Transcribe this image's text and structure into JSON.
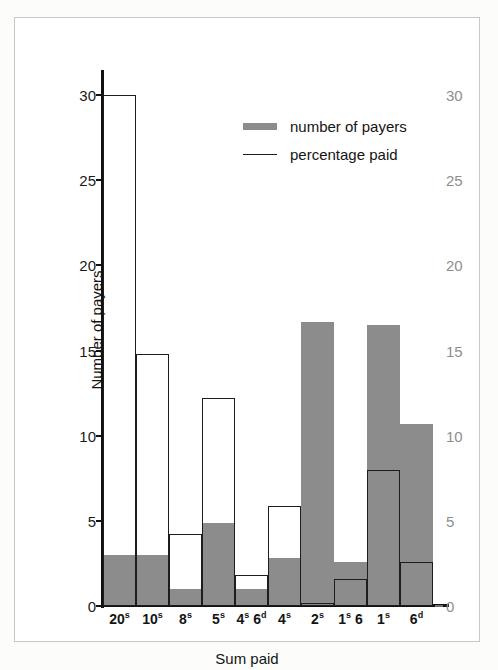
{
  "chart_data": {
    "type": "bar",
    "title": "",
    "xlabel": "Sum paid",
    "ylabel": "Number of payers",
    "ylabel_right": "Percentage of whole sum",
    "categories": [
      "20s",
      "10s",
      "8s",
      "5s",
      "4s 6d",
      "4s",
      "2s",
      "1s 6",
      "1s",
      "6d"
    ],
    "category_labels": [
      {
        "main": "20",
        "sup": "s"
      },
      {
        "main": "10",
        "sup": "s"
      },
      {
        "main": "8",
        "sup": "s"
      },
      {
        "main": "5",
        "sup": "s"
      },
      {
        "main": "4",
        "sup": "s",
        "main2": " 6",
        "sup2": "d"
      },
      {
        "main": "4",
        "sup": "s"
      },
      {
        "main": "2",
        "sup": "s"
      },
      {
        "main": "1",
        "sup": "s",
        "main2": " 6",
        "sup2": ""
      },
      {
        "main": "1",
        "sup": "s"
      },
      {
        "main": "6",
        "sup": "d"
      }
    ],
    "ylim": [
      0,
      31
    ],
    "ylim_right": [
      0,
      31
    ],
    "yticks": [
      0,
      5,
      10,
      15,
      20,
      25,
      30
    ],
    "yticks_right": [
      0,
      5,
      10,
      15,
      20,
      25,
      30
    ],
    "grid": false,
    "legend_position": "upper-center",
    "series": [
      {
        "name": "number of payers",
        "style": "filled-bar",
        "color": "#8c8c8c",
        "axis": "left",
        "values": [
          3.0,
          3.0,
          1.0,
          4.9,
          1.0,
          2.8,
          16.7,
          2.6,
          16.5,
          10.7
        ]
      },
      {
        "name": "percentage paid",
        "style": "outline-step",
        "color": "#1d1d1d",
        "axis": "right",
        "values": [
          30.0,
          14.8,
          4.2,
          12.2,
          1.8,
          5.9,
          0.2,
          1.6,
          8.0,
          2.6
        ]
      }
    ]
  },
  "legend": {
    "items": [
      {
        "label": "number of payers",
        "swatch": "thick-gray-bar"
      },
      {
        "label": "percentage paid",
        "swatch": "thin-black-line"
      }
    ]
  },
  "colors": {
    "bar_gray": "#8c8c8c",
    "line_black": "#1d1d1d",
    "right_axis_gray": "#8e8e8e",
    "frame": "#c9c9c4",
    "page_background": "#fcfcfa"
  },
  "caption": ""
}
